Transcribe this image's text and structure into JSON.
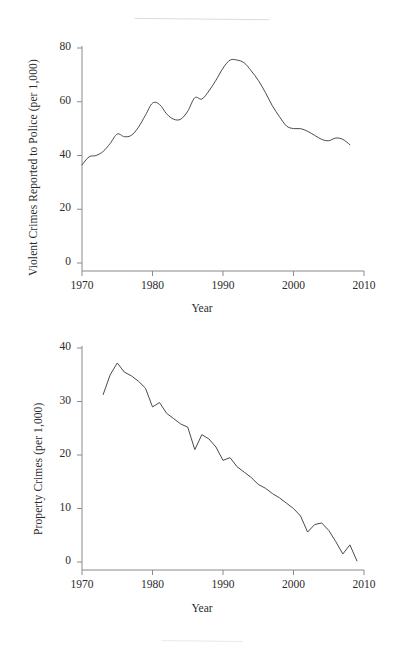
{
  "page": {
    "background_color": "#ffffff",
    "ink_color": "#2b2b2b",
    "axis_color": "#8a8a8a",
    "line_color": "#4a4a4a",
    "rule_color": "#999999",
    "top_rule_name": "page-top-rule",
    "bottom_rule_name": "page-bottom-rule"
  },
  "figures": [
    {
      "id": "violent-crimes",
      "ylabel": "Violent Crimes Reported to Police (per 1,000)",
      "xlabel": "Year",
      "ytick_labels": [
        "0",
        "20",
        "40",
        "60",
        "80"
      ],
      "xtick_labels": [
        "1970",
        "1980",
        "1990",
        "2000",
        "2010"
      ]
    },
    {
      "id": "property-crimes",
      "ylabel": "Property Crimes (per 1,000)",
      "xlabel": "Year",
      "ytick_labels": [
        "0",
        "10",
        "20",
        "30",
        "40"
      ],
      "xtick_labels": [
        "1970",
        "1980",
        "1990",
        "2000",
        "2010"
      ]
    }
  ],
  "chart_data": [
    {
      "type": "line",
      "title": "",
      "xlabel": "Year",
      "ylabel": "Violent Crimes Reported to Police (per 1,000)",
      "xlim": [
        1970,
        2010
      ],
      "ylim": [
        0,
        80
      ],
      "xticks": [
        1970,
        1980,
        1990,
        2000,
        2010
      ],
      "yticks": [
        0,
        20,
        40,
        60,
        80
      ],
      "grid": false,
      "legend": "none",
      "series": [
        {
          "name": "Violent crimes reported to police",
          "x": [
            1970,
            1971,
            1972,
            1973,
            1974,
            1975,
            1976,
            1977,
            1978,
            1979,
            1980,
            1981,
            1982,
            1983,
            1984,
            1985,
            1986,
            1987,
            1988,
            1989,
            1990,
            1991,
            1992,
            1993,
            1994,
            1995,
            1996,
            1997,
            1998,
            1999,
            2000,
            2001,
            2002,
            2003,
            2004,
            2005,
            2006,
            2007,
            2008
          ],
          "values": [
            36.5,
            39.5,
            40.0,
            41.5,
            44.5,
            48.0,
            47.0,
            47.5,
            50.5,
            55.0,
            59.5,
            59.0,
            55.5,
            53.5,
            53.5,
            56.5,
            61.5,
            61.0,
            64.0,
            68.0,
            72.5,
            75.5,
            75.5,
            74.5,
            71.5,
            68.0,
            63.5,
            58.5,
            54.5,
            51.0,
            50.0,
            50.0,
            49.0,
            47.5,
            46.0,
            45.5,
            46.5,
            46.0,
            44.0
          ]
        }
      ]
    },
    {
      "type": "line",
      "title": "",
      "xlabel": "Year",
      "ylabel": "Property Crimes (per 1,000)",
      "xlim": [
        1970,
        2010
      ],
      "ylim": [
        0,
        40
      ],
      "xticks": [
        1970,
        1980,
        1990,
        2000,
        2010
      ],
      "yticks": [
        0,
        10,
        20,
        30,
        40
      ],
      "grid": false,
      "legend": "none",
      "series": [
        {
          "name": "Property crimes",
          "x": [
            1973,
            1974,
            1975,
            1976,
            1977,
            1978,
            1979,
            1980,
            1981,
            1982,
            1983,
            1984,
            1985,
            1986,
            1987,
            1988,
            1989,
            1990,
            1991,
            1992,
            1993,
            1994,
            1995,
            1996,
            1997,
            1998,
            1999,
            2000,
            2001,
            2002,
            2003,
            2004,
            2005,
            2006,
            2007,
            2008,
            2009
          ],
          "values": [
            31.3,
            35.0,
            37.2,
            35.5,
            34.8,
            33.8,
            32.5,
            29.0,
            29.8,
            27.8,
            26.8,
            25.8,
            25.2,
            21.0,
            23.8,
            23.0,
            21.5,
            19.0,
            19.5,
            17.8,
            16.8,
            15.8,
            14.5,
            13.8,
            12.8,
            12.0,
            11.0,
            10.0,
            8.6,
            5.6,
            7.0,
            7.3,
            5.9,
            3.8,
            1.5,
            3.2,
            0.2
          ]
        }
      ]
    }
  ]
}
